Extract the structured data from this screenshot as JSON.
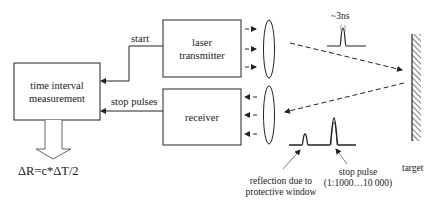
{
  "diagram": {
    "type": "laser rangefinder block diagram",
    "blocks": {
      "time_interval": {
        "line1": "time interval",
        "line2": "measurement"
      },
      "laser_transmitter": {
        "line1": "laser",
        "line2": "transmitter"
      },
      "receiver": {
        "label": "receiver"
      }
    },
    "connections": {
      "start": "start",
      "stop_pulses": "stop pulses"
    },
    "formula": "ΔR=c*ΔT/2",
    "pulse_width": "~3ns",
    "target_label": "target",
    "annotations": {
      "reflection_line1": "reflection due to",
      "reflection_line2": "protective window",
      "stop_pulse_line1": "stop pulse",
      "stop_pulse_line2": "(1:1000…10 000)"
    },
    "colors": {
      "line": "#222222",
      "background": "#ffffff"
    }
  }
}
